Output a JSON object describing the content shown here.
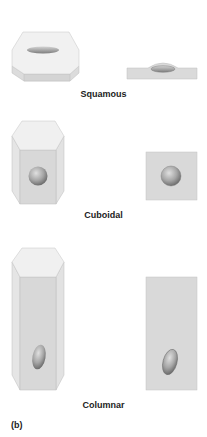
{
  "figure": {
    "panel_label": "(b)",
    "rows": [
      {
        "name": "squamous",
        "label": "Squamous"
      },
      {
        "name": "cuboidal",
        "label": "Cuboidal"
      },
      {
        "name": "columnar",
        "label": "Columnar"
      }
    ],
    "colors": {
      "top_face": "#efefef",
      "front_face": "#d9d9d9",
      "side_face": "#e6e6e6",
      "edge": "#b8b8b8",
      "nucleus_light": "#cfcfcf",
      "nucleus_dark": "#7a7a7a"
    }
  }
}
